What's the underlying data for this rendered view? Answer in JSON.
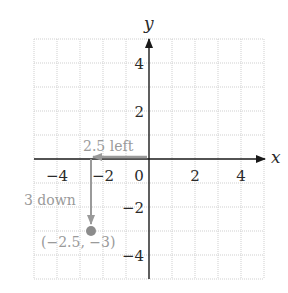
{
  "diagram": {
    "x_axis_label": "x",
    "y_axis_label": "y",
    "x_ticks": [
      {
        "value": -4,
        "label": "−4"
      },
      {
        "value": -2,
        "label": "−2"
      },
      {
        "value": 0,
        "label": "0"
      },
      {
        "value": 2,
        "label": "2"
      },
      {
        "value": 4,
        "label": "4"
      }
    ],
    "y_ticks": [
      {
        "value": 4,
        "label": "4"
      },
      {
        "value": 2,
        "label": "2"
      },
      {
        "value": -2,
        "label": "−2"
      },
      {
        "value": -4,
        "label": "−4"
      }
    ],
    "range": {
      "x": [
        -5,
        5
      ],
      "y": [
        -5,
        5
      ]
    },
    "grid": true,
    "annotations": {
      "left_move": "2.5 left",
      "down_move": "3 down"
    },
    "point": {
      "x": -2.5,
      "y": -3,
      "label": "(−2.5, −3)"
    },
    "colors": {
      "axis": "#1a1a1a",
      "grid": "#c8c8c8",
      "annotation": "#9a9a9a",
      "point": "#8c8c8c"
    }
  }
}
